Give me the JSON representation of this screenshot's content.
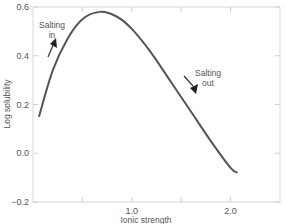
{
  "chart_data": {
    "type": "line",
    "title": "",
    "xlabel": "Ionic strength",
    "ylabel": "Log solubility",
    "xlim": [
      0,
      2.5
    ],
    "ylim": [
      -0.2,
      0.6
    ],
    "x_ticks": [
      0.5,
      1.0,
      1.5,
      2.0
    ],
    "x_tick_labels": [
      "",
      "1.0",
      "",
      "2.0"
    ],
    "y_ticks": [
      -0.2,
      0.0,
      0.2,
      0.4,
      0.6
    ],
    "y_tick_labels": [
      "−0.2",
      "0.0",
      "0.2",
      "0.4",
      "0.6"
    ],
    "grid": false,
    "legend": null,
    "series": [
      {
        "name": "Log solubility",
        "color": "#555555",
        "x": [
          0.06,
          0.2,
          0.35,
          0.5,
          0.68,
          0.85,
          1.0,
          1.2,
          1.4,
          1.6,
          1.8,
          2.0,
          2.07
        ],
        "y": [
          0.15,
          0.34,
          0.47,
          0.55,
          0.58,
          0.56,
          0.51,
          0.41,
          0.29,
          0.17,
          0.05,
          -0.06,
          -0.08
        ]
      }
    ],
    "annotations": [
      {
        "text_lines": [
          "Salting",
          "in"
        ],
        "arrow": "up-right",
        "x": 0.35,
        "y": 0.53
      },
      {
        "text_lines": [
          "Salting",
          "out"
        ],
        "arrow": "down-right",
        "x": 1.8,
        "y": 0.28
      }
    ]
  }
}
